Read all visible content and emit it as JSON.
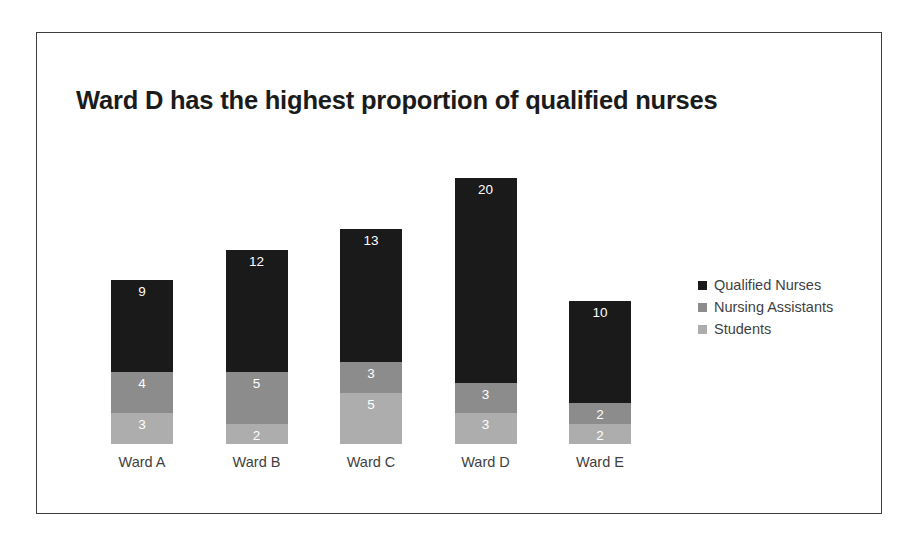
{
  "figure": {
    "border_color": "#3d3d3d",
    "background": "#ffffff"
  },
  "chart_data": {
    "type": "bar",
    "subtype": "stacked-bar",
    "title": "Ward D has the highest proportion of qualified nurses",
    "subtitle": "",
    "xlabel": "",
    "ylabel": "",
    "categories": [
      "Ward A",
      "Ward B",
      "Ward C",
      "Ward D",
      "Ward E"
    ],
    "series": [
      {
        "name": "Qualified Nurses",
        "color": "#1a1a1a",
        "values": [
          9,
          12,
          13,
          20,
          10
        ]
      },
      {
        "name": "Nursing Assistants",
        "color": "#8c8c8c",
        "values": [
          4,
          5,
          3,
          3,
          2
        ]
      },
      {
        "name": "Students",
        "color": "#adadad",
        "values": [
          3,
          2,
          5,
          3,
          2
        ]
      }
    ],
    "stack_order_bottom_to_top": [
      "Students",
      "Nursing Assistants",
      "Qualified Nurses"
    ],
    "totals": [
      16,
      19,
      21,
      26,
      14
    ],
    "ylim": [
      0,
      26
    ],
    "grid": false,
    "axis_visible": false,
    "data_labels": true,
    "data_label_color": "#ffffff",
    "legend_position": "right"
  },
  "legend": {
    "items": [
      {
        "label": "Qualified Nurses",
        "color": "#1a1a1a"
      },
      {
        "label": "Nursing Assistants",
        "color": "#8c8c8c"
      },
      {
        "label": "Students",
        "color": "#adadad"
      }
    ]
  },
  "labels": {
    "bars": [
      {
        "category": "Ward A",
        "qualified": "9",
        "assistants": "4",
        "students": "3"
      },
      {
        "category": "Ward B",
        "qualified": "12",
        "assistants": "5",
        "students": "2"
      },
      {
        "category": "Ward C",
        "qualified": "13",
        "assistants": "3",
        "students": "5"
      },
      {
        "category": "Ward D",
        "qualified": "20",
        "assistants": "3",
        "students": "3"
      },
      {
        "category": "Ward E",
        "qualified": "10",
        "assistants": "2",
        "students": "2"
      }
    ]
  }
}
